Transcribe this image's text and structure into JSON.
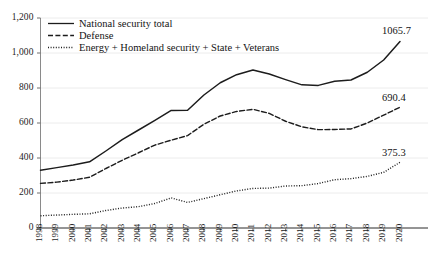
{
  "chart_data": {
    "type": "line",
    "title": "",
    "subtitle": "",
    "xlabel": "",
    "ylabel": "",
    "grid": "horizontal",
    "legend_position": "top-left",
    "xlim": [
      1998,
      2020
    ],
    "ylim": [
      0,
      1200
    ],
    "ytick_labels": [
      "1,200",
      "1,000",
      "800",
      "600",
      "400",
      "200",
      "0"
    ],
    "ytick_values": [
      1200,
      1000,
      800,
      600,
      400,
      200,
      0
    ],
    "categories": [
      "1998",
      "1999",
      "2000",
      "2001",
      "2002",
      "2003",
      "2004",
      "2005",
      "2006",
      "2007",
      "2008",
      "2009",
      "2010",
      "2011",
      "2012",
      "2013",
      "2014",
      "2015",
      "2016",
      "2017",
      "2018",
      "2019",
      "2020"
    ],
    "series": [
      {
        "name": "National security total",
        "style": "solid",
        "color": "#1c1c1c",
        "end_label": "1065.7",
        "values": [
          330.0,
          345.0,
          360.0,
          378.0,
          440.0,
          505.0,
          560.0,
          615.0,
          672.0,
          673.0,
          760.0,
          830.0,
          876.0,
          903.0,
          880.0,
          848.0,
          818.0,
          815.0,
          838.0,
          846.0,
          890.0,
          960.0,
          1065.7
        ]
      },
      {
        "name": "Defense",
        "style": "dashed",
        "color": "#1c1c1c",
        "end_label": "690.4",
        "values": [
          255.0,
          262.0,
          274.0,
          290.0,
          340.0,
          387.0,
          430.0,
          474.0,
          502.0,
          528.0,
          593.0,
          640.0,
          666.0,
          678.0,
          655.0,
          610.0,
          578.0,
          562.0,
          563.0,
          566.0,
          600.0,
          645.0,
          690.4
        ]
      },
      {
        "name": "Energy + Homeland security + State + Veterans",
        "style": "dotted",
        "color": "#1c1c1c",
        "end_label": "375.3",
        "values": [
          70.0,
          74.0,
          78.0,
          81.0,
          100.0,
          114.0,
          122.0,
          140.0,
          172.0,
          146.0,
          168.0,
          190.0,
          212.0,
          226.0,
          228.0,
          240.0,
          242.0,
          254.0,
          276.0,
          282.0,
          295.0,
          318.0,
          375.3
        ]
      }
    ]
  },
  "legend": {
    "items": [
      {
        "label": "National security total",
        "style": "solid"
      },
      {
        "label": "Defense",
        "style": "dashed"
      },
      {
        "label": "Energy + Homeland security + State + Veterans",
        "style": "dotted"
      }
    ]
  },
  "end_labels": [
    {
      "text": "1065.7"
    },
    {
      "text": "690.4"
    },
    {
      "text": "375.3"
    }
  ]
}
